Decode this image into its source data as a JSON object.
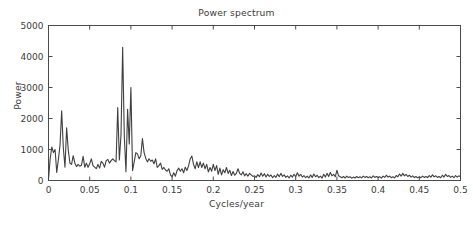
{
  "chart_data": {
    "type": "line",
    "title": "Power spectrum",
    "xlabel": "Cycles/year",
    "ylabel": "Power",
    "xlim": [
      0,
      0.5
    ],
    "ylim": [
      0,
      5000
    ],
    "grid": false,
    "legend": null,
    "xticks": [
      0,
      0.05,
      0.1,
      0.15,
      0.2,
      0.25,
      0.3,
      0.35,
      0.4,
      0.45,
      0.5
    ],
    "xticklabels": [
      "0",
      "0.05",
      "0.1",
      "0.15",
      "0.2",
      "0.25",
      "0.3",
      "0.35",
      "0.4",
      "0.45",
      "0.5"
    ],
    "yticks": [
      0,
      1000,
      2000,
      3000,
      4000,
      5000
    ],
    "yticklabels": [
      "0",
      "1000",
      "2000",
      "3000",
      "4000",
      "5000"
    ],
    "line_color": "#3f3f3f",
    "line_width": 1.1,
    "series": [
      {
        "name": "power",
        "x": [
          0.0,
          0.002,
          0.004,
          0.006,
          0.008,
          0.01,
          0.012,
          0.014,
          0.016,
          0.018,
          0.02,
          0.022,
          0.024,
          0.026,
          0.028,
          0.03,
          0.032,
          0.034,
          0.036,
          0.038,
          0.04,
          0.042,
          0.044,
          0.046,
          0.048,
          0.05,
          0.052,
          0.054,
          0.056,
          0.058,
          0.06,
          0.062,
          0.064,
          0.066,
          0.068,
          0.07,
          0.072,
          0.074,
          0.076,
          0.078,
          0.08,
          0.082,
          0.084,
          0.086,
          0.088,
          0.09,
          0.092,
          0.094,
          0.096,
          0.098,
          0.1,
          0.102,
          0.104,
          0.106,
          0.108,
          0.11,
          0.112,
          0.114,
          0.116,
          0.118,
          0.12,
          0.122,
          0.124,
          0.126,
          0.128,
          0.13,
          0.132,
          0.134,
          0.136,
          0.138,
          0.14,
          0.142,
          0.144,
          0.146,
          0.148,
          0.15,
          0.152,
          0.154,
          0.156,
          0.158,
          0.16,
          0.162,
          0.164,
          0.166,
          0.168,
          0.17,
          0.172,
          0.174,
          0.176,
          0.178,
          0.18,
          0.182,
          0.184,
          0.186,
          0.188,
          0.19,
          0.192,
          0.194,
          0.196,
          0.198,
          0.2,
          0.202,
          0.204,
          0.206,
          0.208,
          0.21,
          0.212,
          0.214,
          0.216,
          0.218,
          0.22,
          0.222,
          0.224,
          0.226,
          0.228,
          0.23,
          0.232,
          0.234,
          0.236,
          0.238,
          0.24,
          0.242,
          0.244,
          0.246,
          0.248,
          0.25,
          0.252,
          0.254,
          0.256,
          0.258,
          0.26,
          0.262,
          0.264,
          0.266,
          0.268,
          0.27,
          0.272,
          0.274,
          0.276,
          0.278,
          0.28,
          0.282,
          0.284,
          0.286,
          0.288,
          0.29,
          0.292,
          0.294,
          0.296,
          0.298,
          0.3,
          0.302,
          0.304,
          0.306,
          0.308,
          0.31,
          0.312,
          0.314,
          0.316,
          0.318,
          0.32,
          0.322,
          0.324,
          0.326,
          0.328,
          0.33,
          0.332,
          0.334,
          0.336,
          0.338,
          0.34,
          0.342,
          0.344,
          0.346,
          0.348,
          0.35,
          0.352,
          0.354,
          0.356,
          0.358,
          0.36,
          0.362,
          0.364,
          0.366,
          0.368,
          0.37,
          0.372,
          0.374,
          0.376,
          0.378,
          0.38,
          0.382,
          0.384,
          0.386,
          0.388,
          0.39,
          0.392,
          0.394,
          0.396,
          0.398,
          0.4,
          0.402,
          0.404,
          0.406,
          0.408,
          0.41,
          0.412,
          0.414,
          0.416,
          0.418,
          0.42,
          0.422,
          0.424,
          0.426,
          0.428,
          0.43,
          0.432,
          0.434,
          0.436,
          0.438,
          0.44,
          0.442,
          0.444,
          0.446,
          0.448,
          0.45,
          0.452,
          0.454,
          0.456,
          0.458,
          0.46,
          0.462,
          0.464,
          0.466,
          0.468,
          0.47,
          0.472,
          0.474,
          0.476,
          0.478,
          0.48,
          0.482,
          0.484,
          0.486,
          0.488,
          0.49,
          0.492,
          0.494,
          0.496,
          0.498,
          0.5
        ],
        "y": [
          30,
          700,
          1080,
          900,
          1000,
          260,
          680,
          1150,
          2250,
          1050,
          430,
          1700,
          980,
          560,
          520,
          800,
          560,
          450,
          520,
          460,
          490,
          780,
          430,
          560,
          430,
          540,
          700,
          480,
          430,
          380,
          520,
          400,
          620,
          560,
          430,
          640,
          680,
          560,
          640,
          700,
          640,
          600,
          2350,
          660,
          1480,
          4300,
          1430,
          280,
          2300,
          1180,
          3000,
          320,
          600,
          900,
          860,
          700,
          800,
          1350,
          900,
          720,
          600,
          700,
          620,
          660,
          540,
          700,
          420,
          480,
          560,
          360,
          420,
          340,
          300,
          380,
          180,
          120,
          250,
          140,
          320,
          400,
          300,
          380,
          250,
          430,
          320,
          480,
          700,
          790,
          520,
          380,
          600,
          420,
          600,
          420,
          560,
          380,
          520,
          280,
          420,
          300,
          520,
          320,
          480,
          200,
          400,
          180,
          350,
          250,
          420,
          230,
          330,
          160,
          290,
          170,
          230,
          380,
          230,
          180,
          280,
          150,
          220,
          140,
          230,
          180,
          130,
          150,
          100,
          190,
          120,
          240,
          140,
          220,
          110,
          200,
          130,
          180,
          90,
          160,
          100,
          210,
          120,
          230,
          130,
          180,
          100,
          150,
          80,
          170,
          110,
          200,
          120,
          250,
          140,
          200,
          110,
          160,
          90,
          140,
          80,
          180,
          100,
          210,
          120,
          170,
          95,
          140,
          75,
          200,
          110,
          230,
          130,
          260,
          150,
          200,
          120,
          330,
          150,
          120,
          90,
          130,
          80,
          140,
          95,
          120,
          75,
          110,
          80,
          130,
          90,
          120,
          85,
          140,
          100,
          130,
          90,
          120,
          80,
          150,
          100,
          130,
          95,
          120,
          75,
          140,
          100,
          170,
          110,
          140,
          90,
          120,
          85,
          160,
          120,
          210,
          140,
          230,
          150,
          200,
          130,
          170,
          110,
          150,
          95,
          130,
          85,
          120,
          90,
          140,
          100,
          130,
          95,
          160,
          110,
          180,
          120,
          150,
          100,
          130,
          90,
          170,
          110,
          200,
          130,
          160,
          100,
          140,
          90,
          160,
          110,
          150,
          120
        ]
      }
    ]
  }
}
